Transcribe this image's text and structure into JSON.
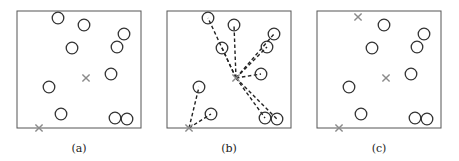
{
  "figure": {
    "colors": {
      "border": "#555555",
      "point": "#333333",
      "center": "#8a8a8a",
      "assignment_line": "#222222"
    },
    "points": [
      [
        58,
        18
      ],
      [
        84,
        25
      ],
      [
        124,
        34
      ],
      [
        117,
        47
      ],
      [
        72,
        48
      ],
      [
        111,
        74
      ],
      [
        49,
        87
      ],
      [
        61,
        114
      ],
      [
        115,
        118
      ],
      [
        127,
        119
      ]
    ],
    "panels": [
      {
        "caption": "(a)",
        "offset_x": 0,
        "hidden_points": [],
        "centers": [
          [
            86,
            78
          ],
          [
            39,
            128
          ]
        ],
        "assignments": []
      },
      {
        "caption": "(b)",
        "offset_x": 150,
        "hidden_points": [],
        "centers": [
          [
            86,
            78
          ],
          [
            39,
            128
          ]
        ],
        "assignments": [
          [
            0,
            0
          ],
          [
            0,
            1
          ],
          [
            0,
            2
          ],
          [
            0,
            3
          ],
          [
            0,
            4
          ],
          [
            0,
            5
          ],
          [
            0,
            8
          ],
          [
            0,
            9
          ],
          [
            1,
            6
          ],
          [
            1,
            7
          ]
        ]
      },
      {
        "caption": "(c)",
        "offset_x": 300,
        "hidden_points": [
          0
        ],
        "centers": [
          [
            58,
            17
          ],
          [
            86,
            78
          ],
          [
            39,
            128
          ]
        ],
        "assignments": []
      }
    ],
    "frame": {
      "x": 17,
      "y": 11,
      "w": 124,
      "h": 117
    },
    "caption_y": 152
  }
}
